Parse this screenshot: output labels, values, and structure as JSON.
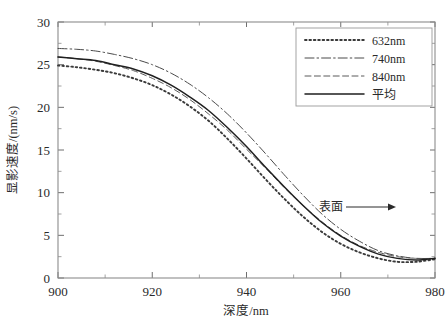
{
  "chart_data": {
    "type": "line",
    "title": "",
    "xlabel": "深度/nm",
    "ylabel": "显影速度/(nm/s)",
    "xlim": [
      900,
      980
    ],
    "ylim": [
      0,
      30
    ],
    "xticks": [
      "900",
      "920",
      "940",
      "960",
      "980"
    ],
    "yticks": [
      "0",
      "5",
      "10",
      "15",
      "20",
      "25",
      "30"
    ],
    "xtick_values": [
      900,
      920,
      940,
      960,
      980
    ],
    "ytick_values": [
      0,
      5,
      10,
      15,
      20,
      25,
      30
    ],
    "grid": false,
    "minor_ticks": true,
    "legend_position": "top-right-inside",
    "x": [
      900,
      904,
      908,
      912,
      916,
      920,
      924,
      928,
      932,
      936,
      940,
      944,
      948,
      952,
      956,
      960,
      964,
      968,
      972,
      976,
      980
    ],
    "series": [
      {
        "name": "632nm",
        "style": "dotted",
        "color": "#3a3a3a",
        "values": [
          24.9,
          24.7,
          24.4,
          24.0,
          23.4,
          22.6,
          21.5,
          20.1,
          18.4,
          16.3,
          14.0,
          11.6,
          9.3,
          7.2,
          5.4,
          4.0,
          3.0,
          2.3,
          1.9,
          1.9,
          2.2
        ]
      },
      {
        "name": "740nm",
        "style": "dashdot",
        "color": "#4a4a4a",
        "values": [
          26.9,
          26.8,
          26.6,
          26.2,
          25.7,
          25.0,
          24.0,
          22.7,
          21.1,
          19.2,
          17.0,
          14.6,
          12.1,
          9.7,
          7.5,
          5.7,
          4.3,
          3.2,
          2.6,
          2.3,
          2.3
        ]
      },
      {
        "name": "840nm",
        "style": "dashed",
        "color": "#5a5a5a",
        "values": [
          25.9,
          25.7,
          25.4,
          24.9,
          24.3,
          23.4,
          22.3,
          20.9,
          19.2,
          17.3,
          15.1,
          12.9,
          10.6,
          8.5,
          6.6,
          5.0,
          3.8,
          3.0,
          2.5,
          2.3,
          2.3
        ]
      },
      {
        "name": "平均",
        "style": "solid",
        "color": "#1f1f1f",
        "values": [
          25.9,
          25.7,
          25.5,
          25.0,
          24.5,
          23.7,
          22.6,
          21.2,
          19.6,
          17.6,
          15.4,
          13.0,
          10.7,
          8.5,
          6.5,
          4.9,
          3.7,
          2.8,
          2.3,
          2.1,
          2.3
        ]
      }
    ],
    "annotations": [
      {
        "text": "表面",
        "arrow": "right",
        "x": 962,
        "y": 7.8
      }
    ]
  },
  "legend": {
    "items": [
      {
        "label": "632nm"
      },
      {
        "label": "740nm"
      },
      {
        "label": "840nm"
      },
      {
        "label": "平均"
      }
    ]
  },
  "annotation": {
    "surface_label": "表面"
  }
}
